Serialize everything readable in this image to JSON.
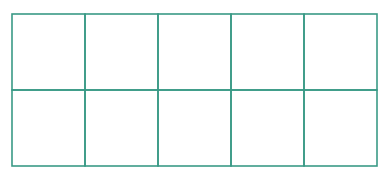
{
  "diagram": {
    "type": "grid",
    "rows": 2,
    "columns": 5,
    "line_color": "#3a9a86",
    "cells": [
      [
        "",
        "",
        "",
        "",
        ""
      ],
      [
        "",
        "",
        "",
        "",
        ""
      ]
    ]
  }
}
